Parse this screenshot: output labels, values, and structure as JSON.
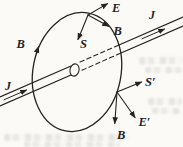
{
  "figure": {
    "paper_color": "#fbfaf6",
    "ink_color": "#26231e",
    "labels": {
      "e_top": "E",
      "b_top": "B",
      "s_top": "S",
      "j_right": "J",
      "b_left": "B",
      "j_left": "J",
      "s_prime": "S′",
      "e_prime": "E′",
      "b_bottom": "B"
    }
  }
}
